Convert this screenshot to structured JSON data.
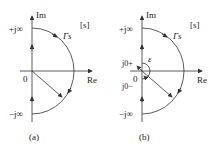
{
  "panels": [
    {
      "id": "a",
      "caption": "(a)",
      "axis_im": "Im",
      "axis_re": "Re",
      "plane": "[s]",
      "contour": "Γs",
      "top_label": "+j∞",
      "bottom_label": "−j∞",
      "origin": "0"
    },
    {
      "id": "b",
      "caption": "(b)",
      "axis_im": "Im",
      "axis_re": "Re",
      "plane": "[s]",
      "contour": "Γs",
      "top_label": "+j∞",
      "bottom_label": "−j∞",
      "origin": "0",
      "j0plus": "j0+",
      "j0minus": "j0−",
      "epsilon": "ε"
    }
  ],
  "colors": {
    "line": "#333333",
    "text": "#222222"
  }
}
